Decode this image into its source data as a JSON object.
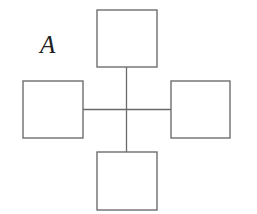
{
  "diagram": {
    "label": "A",
    "stroke_color": "#6e6e6e",
    "line_color": "#6a6a6a",
    "boxes": [
      {
        "name": "top-box",
        "x": 97,
        "y": 10,
        "w": 60,
        "h": 57
      },
      {
        "name": "left-box",
        "x": 23,
        "y": 81,
        "w": 60,
        "h": 57
      },
      {
        "name": "right-box",
        "x": 171,
        "y": 81,
        "w": 59,
        "h": 57
      },
      {
        "name": "bottom-box",
        "x": 97,
        "y": 152,
        "w": 60,
        "h": 58
      }
    ],
    "connectors": {
      "vertical": {
        "x": 126.5,
        "y1": 67,
        "y2": 152
      },
      "horizontal": {
        "y": 109.5,
        "x1": 83,
        "x2": 171
      }
    }
  }
}
